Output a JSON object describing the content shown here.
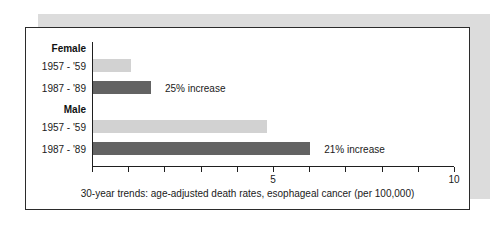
{
  "chart_data": {
    "type": "bar",
    "orientation": "horizontal",
    "title": "",
    "xlabel": "30-year trends: age-adjusted death rates, esophageal cancer (per 100,000)",
    "ylabel": "",
    "xlim": [
      0,
      10
    ],
    "xticks": [
      0,
      1,
      2,
      3,
      4,
      5,
      6,
      7,
      8,
      9,
      10
    ],
    "xtick_labels": [
      "",
      "",
      "",
      "",
      "",
      "5",
      "",
      "",
      "",
      "",
      "10"
    ],
    "grid": false,
    "legend": "none",
    "groups": [
      {
        "name": "Female",
        "bars": [
          {
            "label": "1957 - '59",
            "value": 1.05,
            "style": "light",
            "note": ""
          },
          {
            "label": "1987 - '89",
            "value": 1.6,
            "style": "dark",
            "note": "25% increase"
          }
        ]
      },
      {
        "name": "Male",
        "bars": [
          {
            "label": "1957 - '59",
            "value": 4.8,
            "style": "light",
            "note": ""
          },
          {
            "label": "1987 - '89",
            "value": 6.0,
            "style": "dark",
            "note": "21% increase"
          }
        ]
      }
    ],
    "categories": [
      "Female 1957 - '59",
      "Female 1987 - '89",
      "Male 1957 - '59",
      "Male 1987 - '89"
    ],
    "values": [
      1.05,
      1.6,
      4.8,
      6.0
    ],
    "annotations": [
      "25% increase",
      "21% increase"
    ],
    "colors": {
      "light_bar": "#d2d2d2",
      "dark_bar": "#636363",
      "axis": "#1f1f1f",
      "frame_border": "#2b2b2b",
      "shadow_block": "#dcdcdc",
      "text": "#1a1a1a"
    }
  },
  "caption": "30-year trends: age-adjusted death rates, esophageal cancer (per 100,000)",
  "tick_5": "5",
  "tick_10": "10"
}
